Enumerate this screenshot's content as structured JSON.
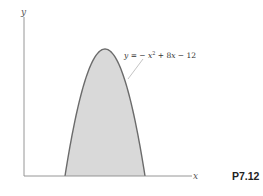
{
  "figure": {
    "problem_label": "P7.12",
    "axes": {
      "x_label": "x",
      "y_label": "y"
    },
    "curve": {
      "equation_parts": {
        "lhs": "y",
        "eq": " = − ",
        "x": "x",
        "exp": "2",
        "mid": " + 8",
        "x2": "x",
        "tail": " − 12"
      },
      "function": "y = -x^2 + 8x - 12",
      "roots": [
        2,
        6
      ],
      "vertex": [
        4,
        4
      ]
    },
    "colors": {
      "fill": "#d9d9d9",
      "stroke": "#6b6b6b",
      "axis": "#8a8a8a",
      "leader": "#9a9a9a"
    }
  }
}
